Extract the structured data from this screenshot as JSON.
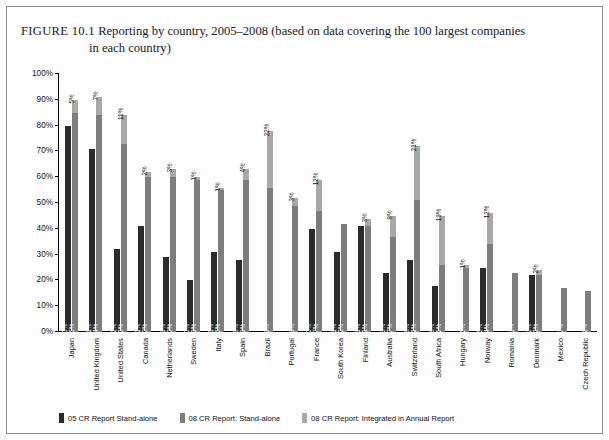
{
  "caption": {
    "figure_label": "FIGURE 10.1",
    "line1": "Reporting by country, 2005–2008 (based on data covering the 100 largest companies",
    "line2": "in each country)"
  },
  "legend": {
    "items": [
      {
        "label": "05 CR Report Stand-alone",
        "color": "#2b2b2b"
      },
      {
        "label": "08 CR Report: Stand-alone",
        "color": "#7d7d7d"
      },
      {
        "label": "08 CR Report: Integrated in Annual Report",
        "color": "#a8a8a8"
      }
    ]
  },
  "chart_data": {
    "type": "bar",
    "title": "Reporting by country, 2005–2008 (based on data covering the 100 largest companies in each country)",
    "xlabel": "",
    "ylabel": "",
    "ylim": [
      0,
      100
    ],
    "grid": false,
    "legend_position": "bottom",
    "y_ticks": [
      "0%",
      "10%",
      "20%",
      "30%",
      "40%",
      "50%",
      "60%",
      "70%",
      "80%",
      "90%",
      "100%"
    ],
    "categories": [
      "Japan",
      "United Kingdom",
      "United States",
      "Canada",
      "Netherlands",
      "Sweden",
      "Italy",
      "Spain",
      "Brazil",
      "Portugal",
      "France",
      "South Korea",
      "Finland",
      "Australia",
      "Switzerland",
      "South Africa",
      "Hungary",
      "Norway",
      "Romania",
      "Denmark",
      "Mexico",
      "Czech Republic"
    ],
    "series": [
      {
        "name": "05 CR Report Stand-alone",
        "color": "#2b2b2b",
        "values": [
          80,
          71,
          32,
          41,
          29,
          20,
          31,
          28,
          null,
          null,
          40,
          31,
          41,
          23,
          28,
          18,
          null,
          25,
          null,
          22,
          null,
          null
        ]
      },
      {
        "name": "08 CR Report: Stand-alone",
        "color": "#7d7d7d",
        "values": [
          85,
          84,
          73,
          60,
          60,
          59,
          55,
          59,
          56,
          49,
          47,
          42,
          41,
          37,
          51,
          26,
          25,
          34,
          23,
          22,
          17,
          16
        ]
      },
      {
        "name": "08 CR Report: Integrated in Annual Report",
        "color": "#a8a8a8",
        "values": [
          5,
          7,
          11,
          2,
          3,
          1,
          1,
          4,
          22,
          3,
          12,
          null,
          3,
          8,
          21,
          19,
          1,
          12,
          null,
          2,
          null,
          null
        ]
      }
    ],
    "bar_labels": {
      "Japan": {
        "s05": "80%",
        "s08": "85%",
        "integrated": "5%"
      },
      "United Kingdom": {
        "s05": "71%",
        "s08": "84%",
        "integrated": "7%"
      },
      "United States": {
        "s05": "32%",
        "s08": "73%",
        "integrated": "11%"
      },
      "Canada": {
        "s05": "41%",
        "s08": "60%",
        "integrated": "2%"
      },
      "Netherlands": {
        "s05": "29%",
        "s08": "60%",
        "integrated": "3%"
      },
      "Sweden": {
        "s05": "20%",
        "s08": "59%",
        "integrated": "1%"
      },
      "Italy": {
        "s05": "31%",
        "s08": "55%",
        "integrated": "1%"
      },
      "Spain": {
        "s05": "28%",
        "s08": "59%",
        "integrated": "4%"
      },
      "Brazil": {
        "s05": "",
        "s08": "56%",
        "integrated": "22%"
      },
      "Portugal": {
        "s05": "",
        "s08": "49%",
        "integrated": "3%"
      },
      "France": {
        "s05": "40%",
        "s08": "47%",
        "integrated": "12%"
      },
      "South Korea": {
        "s05": "31%",
        "s08": "42%",
        "integrated": ""
      },
      "Finland": {
        "s05": "41%",
        "s08": "41%",
        "integrated": "3%"
      },
      "Australia": {
        "s05": "23%",
        "s08": "37%",
        "integrated": "8%"
      },
      "Switzerland": {
        "s05": "28%",
        "s08": "51%",
        "integrated": "21%"
      },
      "South Africa": {
        "s05": "18%",
        "s08": "26%",
        "integrated": "19%"
      },
      "Hungary": {
        "s05": "",
        "s08": "25%",
        "integrated": "1%"
      },
      "Norway": {
        "s05": "25%",
        "s08": "34%",
        "integrated": "12%"
      },
      "Romania": {
        "s05": "",
        "s08": "23%",
        "integrated": ""
      },
      "Denmark": {
        "s05": "22%",
        "s08": "22%",
        "integrated": "2%"
      },
      "Mexico": {
        "s05": "",
        "s08": "17%",
        "integrated": ""
      },
      "Czech Republic": {
        "s05": "",
        "s08": "16%",
        "integrated": ""
      }
    }
  }
}
